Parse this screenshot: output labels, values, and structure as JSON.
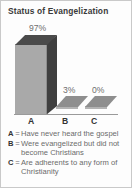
{
  "card": {
    "title": "Status of Evangelization",
    "border_color": "#c9c9c9",
    "background_color": "#fdfdfd"
  },
  "chart_data": {
    "type": "bar",
    "title": "Status of Evangelization",
    "xlabel": "",
    "ylabel": "",
    "ylim": [
      0,
      100
    ],
    "grid": false,
    "legend_position": "below",
    "categories": [
      "A",
      "B",
      "C"
    ],
    "values": [
      97,
      3,
      0
    ],
    "data_labels": [
      "97%",
      "3%",
      "0%"
    ],
    "category_descriptions": [
      "Have never heard the gospel",
      "Were evangelized but did not become Christians",
      "Are adherents to any form of Christianity"
    ],
    "bar_style": "3d-column",
    "bar_front_color": "#a9a9a9",
    "bar_top_color": "#4a4a4a",
    "bar_side_color": "#3f3f3f"
  },
  "axis": {
    "labels": [
      "A",
      "B",
      "C"
    ]
  },
  "legend": {
    "separator": "=",
    "rows": [
      {
        "key": "A",
        "text": "Have never heard the gospel"
      },
      {
        "key": "B",
        "text": "Were evangelized but did not become Christians"
      },
      {
        "key": "C",
        "text": "Are adherents to any form of Christianity"
      }
    ]
  }
}
